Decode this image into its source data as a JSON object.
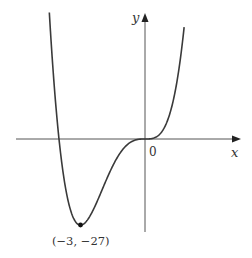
{
  "figure": {
    "axis_labels": {
      "x": "x",
      "y": "y"
    },
    "origin_label": "0",
    "point_label": "(−3, −27)",
    "colors": {
      "curve": "#3a3a3a",
      "axis": "#555555",
      "text": "#333333"
    }
  },
  "chart_data": {
    "type": "line",
    "title": "",
    "function": "f(x) = x^4 + 4x^3",
    "xlabel": "x",
    "ylabel": "y",
    "x_intercepts": [
      -4,
      0
    ],
    "annotated_points": [
      {
        "x": -3,
        "y": -27,
        "label": "(−3, −27)",
        "marker": "filled-dot"
      }
    ],
    "origin_label": "0",
    "grid": false,
    "legend": null,
    "xlim": [
      -4.45,
      1.82
    ],
    "ylim": [
      -27,
      37
    ]
  }
}
